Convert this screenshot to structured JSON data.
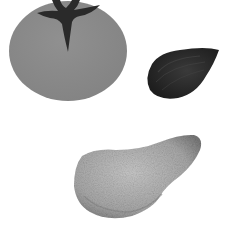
{
  "scene": {
    "description": "Grayscale illustration of three objects on white background",
    "background": "#ffffff",
    "objects": [
      {
        "label": "tomato",
        "color": "#8a8a8a",
        "stem_color": "#2a2a2a"
      },
      {
        "label": "mussel",
        "color": "#2e2e2e"
      },
      {
        "label": "oyster",
        "color": "#b0b0b0"
      }
    ]
  }
}
